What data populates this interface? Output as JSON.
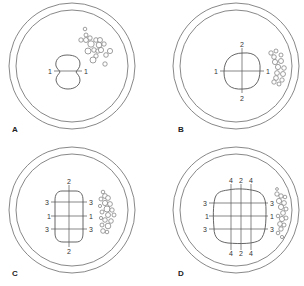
{
  "figure": {
    "panels": [
      {
        "id": "A",
        "label": "A",
        "center": [
          72,
          66
        ],
        "colony": {
          "shape": "peanut",
          "cx": 67,
          "cy": 72,
          "rx": 14,
          "ry": 17
        },
        "lines": [
          {
            "orientation": "horizontal",
            "labels": [
              "1",
              "1"
            ]
          }
        ]
      },
      {
        "id": "B",
        "label": "B",
        "center": [
          236,
          66
        ],
        "colony": {
          "shape": "rounded-square",
          "cx": 242,
          "cy": 71,
          "rx": 18,
          "ry": 18
        },
        "lines": [
          {
            "orientation": "horizontal",
            "labels": [
              "1",
              "1"
            ]
          },
          {
            "orientation": "vertical",
            "labels": [
              "2",
              "2"
            ]
          }
        ]
      },
      {
        "id": "C",
        "label": "C",
        "center": [
          72,
          210
        ],
        "colony": {
          "shape": "rounded-rect",
          "cx": 69,
          "cy": 216,
          "rx": 14,
          "ry": 27
        },
        "lines": [
          {
            "orientation": "horizontal",
            "labels": [
              "3",
              "3"
            ]
          },
          {
            "orientation": "horizontal",
            "labels": [
              "1",
              "1"
            ]
          },
          {
            "orientation": "horizontal",
            "labels": [
              "3",
              "3"
            ]
          },
          {
            "orientation": "vertical",
            "labels": [
              "2",
              "2"
            ]
          }
        ]
      },
      {
        "id": "D",
        "label": "D",
        "center": [
          236,
          210
        ],
        "colony": {
          "shape": "rounded-square",
          "cx": 240,
          "cy": 216,
          "rx": 27,
          "ry": 27
        },
        "lines": [
          {
            "orientation": "horizontal",
            "labels": [
              "3",
              "3"
            ]
          },
          {
            "orientation": "horizontal",
            "labels": [
              "1",
              "1"
            ]
          },
          {
            "orientation": "horizontal",
            "labels": [
              "3",
              "3"
            ]
          },
          {
            "orientation": "vertical",
            "labels": [
              "4",
              "4"
            ]
          },
          {
            "orientation": "vertical",
            "labels": [
              "2",
              "2"
            ]
          },
          {
            "orientation": "vertical",
            "labels": [
              "4",
              "4"
            ]
          }
        ]
      }
    ],
    "colors": {
      "dish_stroke": "#6a6a6a",
      "line_stroke": "#555555",
      "text": "#333333",
      "background": "#ffffff"
    }
  },
  "labels": {
    "A": {
      "panel": "A",
      "h1_left": "1",
      "h1_right": "1"
    },
    "B": {
      "panel": "B",
      "h1_left": "1",
      "h1_right": "1",
      "v_top": "2",
      "v_bottom": "2"
    },
    "C": {
      "panel": "C",
      "h3a_left": "3",
      "h3a_right": "3",
      "h1_left": "1",
      "h1_right": "1",
      "h3b_left": "3",
      "h3b_right": "3",
      "v_top": "2",
      "v_bottom": "2"
    },
    "D": {
      "panel": "D",
      "h3a_left": "3",
      "h3a_right": "3",
      "h1_left": "1",
      "h1_right": "1",
      "h3b_left": "3",
      "h3b_right": "3",
      "v4a_top": "4",
      "v2_top": "2",
      "v4b_top": "4",
      "v4a_bottom": "4",
      "v2_bottom": "2",
      "v4b_bottom": "4"
    }
  }
}
